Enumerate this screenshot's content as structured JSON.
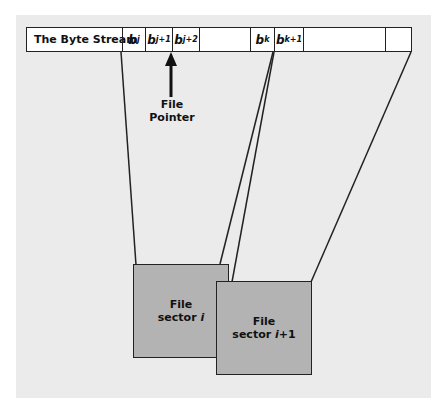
{
  "diagram": {
    "stream": {
      "label": "The Byte Stream",
      "cells": [
        {
          "base": "b",
          "sub": "j"
        },
        {
          "base": "b",
          "sub": "j+1"
        },
        {
          "base": "b",
          "sub": "j+2"
        },
        {
          "base": "",
          "sub": ""
        },
        {
          "base": "b",
          "sub": "k"
        },
        {
          "base": "b",
          "sub": "k+1"
        },
        {
          "base": "",
          "sub": ""
        },
        {
          "base": "",
          "sub": ""
        }
      ]
    },
    "pointer": {
      "line1": "File",
      "line2": "Pointer",
      "icon": "arrow-up-icon"
    },
    "sectors": [
      {
        "line1": "File",
        "line2_prefix": "sector ",
        "index": "i",
        "suffix": ""
      },
      {
        "line1": "File",
        "line2_prefix": "sector ",
        "index": "i",
        "suffix": "+1"
      }
    ],
    "colors": {
      "panel": "#ebebeb",
      "sector_fill": "#b3b3b3",
      "stroke": "#222222"
    }
  }
}
